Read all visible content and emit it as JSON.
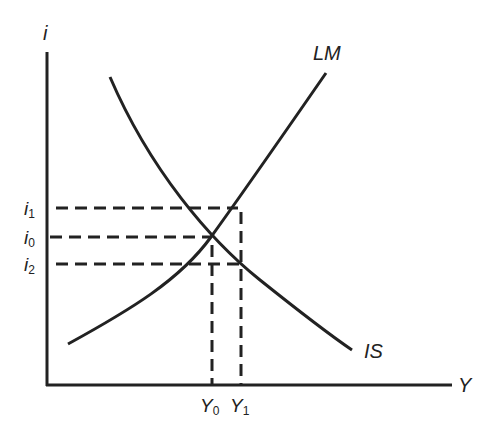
{
  "diagram": {
    "type": "IS-LM model",
    "axes": {
      "y_axis_label": "i",
      "x_axis_label": "Y"
    },
    "curves": [
      {
        "name": "LM",
        "label": "LM",
        "slope": "upward"
      },
      {
        "name": "IS",
        "label": "IS",
        "slope": "downward"
      }
    ],
    "interest_levels": [
      {
        "label": "i",
        "sub": "1"
      },
      {
        "label": "i",
        "sub": "0"
      },
      {
        "label": "i",
        "sub": "2"
      }
    ],
    "output_levels": [
      {
        "label": "Y",
        "sub": "0"
      },
      {
        "label": "Y",
        "sub": "1"
      }
    ],
    "colors": {
      "ink": "#222222",
      "background": "#ffffff"
    }
  }
}
